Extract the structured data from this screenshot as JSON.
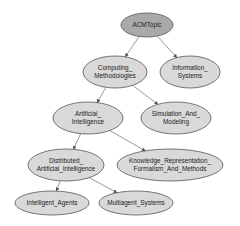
{
  "diagram": {
    "type": "tree",
    "colors": {
      "root_fill": "#a9a9a9",
      "node_fill": "#d9d9d9",
      "stroke": "#555555",
      "text": "#222222",
      "background": "#ffffff"
    },
    "nodes": [
      {
        "id": "acmtopic",
        "lines": [
          "ACMTopic"
        ],
        "cx": 147,
        "cy": 25,
        "rx": 26,
        "ry": 12,
        "root": true
      },
      {
        "id": "computing_methodologies",
        "lines": [
          "Computing_",
          "Methodologies"
        ],
        "cx": 115,
        "cy": 72,
        "rx": 32,
        "ry": 16
      },
      {
        "id": "information_systems",
        "lines": [
          "Information_",
          "Systems"
        ],
        "cx": 190,
        "cy": 72,
        "rx": 30,
        "ry": 16
      },
      {
        "id": "artificial_intelligence",
        "lines": [
          "Artificial_",
          "Intelligence"
        ],
        "cx": 88,
        "cy": 118,
        "rx": 35,
        "ry": 16
      },
      {
        "id": "simulation_and_modeling",
        "lines": [
          "Simulation_And_",
          "Modeling"
        ],
        "cx": 176,
        "cy": 118,
        "rx": 35,
        "ry": 16
      },
      {
        "id": "distributed_artificial_intelligence",
        "lines": [
          "Distributed_",
          "Artificial_Intelligence"
        ],
        "cx": 66,
        "cy": 165,
        "rx": 38,
        "ry": 16
      },
      {
        "id": "knowledge_representation",
        "lines": [
          "Knowledge_Representation_",
          "Formalism_And_Methods"
        ],
        "cx": 170,
        "cy": 165,
        "rx": 53,
        "ry": 16
      },
      {
        "id": "intelligent_agents",
        "lines": [
          "Intelligent_Agents"
        ],
        "cx": 52,
        "cy": 203,
        "rx": 37,
        "ry": 12
      },
      {
        "id": "multiagent_systems",
        "lines": [
          "Multiagent_Systems"
        ],
        "cx": 136,
        "cy": 203,
        "rx": 37,
        "ry": 12
      }
    ],
    "edges": [
      {
        "from": "acmtopic",
        "to": "computing_methodologies"
      },
      {
        "from": "acmtopic",
        "to": "information_systems"
      },
      {
        "from": "computing_methodologies",
        "to": "artificial_intelligence"
      },
      {
        "from": "computing_methodologies",
        "to": "simulation_and_modeling"
      },
      {
        "from": "artificial_intelligence",
        "to": "distributed_artificial_intelligence"
      },
      {
        "from": "artificial_intelligence",
        "to": "knowledge_representation"
      },
      {
        "from": "distributed_artificial_intelligence",
        "to": "intelligent_agents"
      },
      {
        "from": "distributed_artificial_intelligence",
        "to": "multiagent_systems"
      }
    ]
  }
}
